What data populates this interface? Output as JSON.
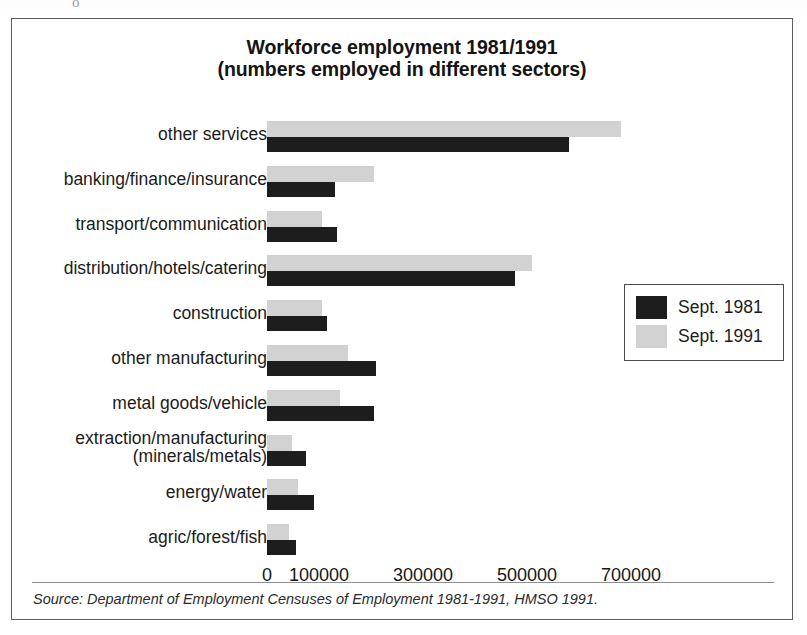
{
  "figure": {
    "scan_artifact_glyph": "o"
  },
  "chart_data": {
    "type": "bar",
    "orientation": "horizontal",
    "title": "Workforce employment 1981/1991",
    "subtitle": "(numbers employed in different sectors)",
    "xlabel": "",
    "ylabel": "",
    "xlim": [
      0,
      750000
    ],
    "grid": false,
    "legend_position": "right",
    "tick_values": [
      0,
      100000,
      300000,
      500000,
      700000
    ],
    "tick_labels": [
      "0",
      "100000",
      "300000",
      "500000",
      "700000"
    ],
    "categories": [
      "other services",
      "banking/finance/insurance",
      "transport/communication",
      "distribution/hotels/catering",
      "construction",
      "other manufacturing",
      "metal goods/vehicle",
      "extraction/manufacturing\n(minerals/metals)",
      "energy/water",
      "agric/forest/fish"
    ],
    "category_lines": [
      [
        "other services"
      ],
      [
        "banking/finance/insurance"
      ],
      [
        "transport/communication"
      ],
      [
        "distribution/hotels/catering"
      ],
      [
        "construction"
      ],
      [
        "other manufacturing"
      ],
      [
        "metal goods/vehicle"
      ],
      [
        "extraction/manufacturing",
        "(minerals/metals)"
      ],
      [
        "energy/water"
      ],
      [
        "agric/forest/fish"
      ]
    ],
    "series": [
      {
        "name": "Sept. 1981",
        "color": "#1d1d1d",
        "values": [
          580000,
          130000,
          135000,
          477000,
          115000,
          210000,
          205000,
          75000,
          90000,
          55000
        ]
      },
      {
        "name": "Sept. 1991",
        "color": "#d2d2d2",
        "values": [
          680000,
          205000,
          105000,
          510000,
          105000,
          155000,
          140000,
          48000,
          60000,
          42000
        ]
      }
    ]
  },
  "legend": {
    "entries": [
      {
        "label": "Sept. 1981",
        "swatch": "black-swatch"
      },
      {
        "label": "Sept. 1991",
        "swatch": "grey-swatch"
      }
    ]
  },
  "source": {
    "note": "Source: Department of Employment Censuses of Employment 1981-1991, HMSO 1991."
  },
  "colors": {
    "series_1981": "#1d1d1d",
    "series_1991": "#d2d2d2",
    "frame": "#5d5d5d",
    "text": "#1b1b1b"
  }
}
